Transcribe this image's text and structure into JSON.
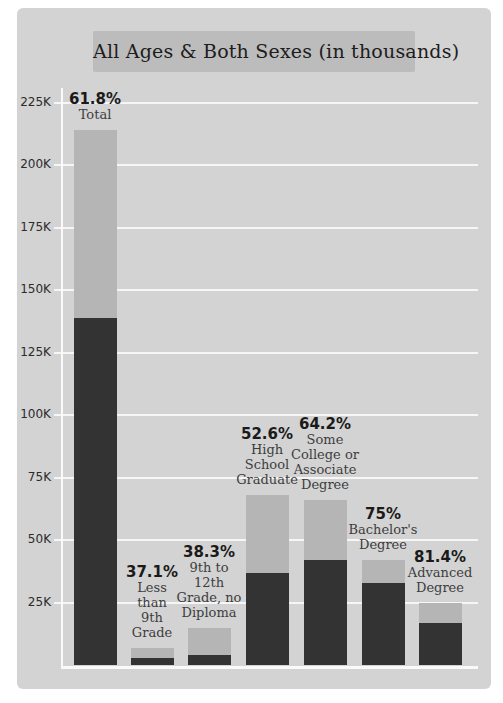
{
  "page_title": "All Ages & Both Sexes (in thousands)",
  "chart_data": {
    "type": "bar",
    "variant": "overlaid-two-tone-stacked",
    "title": "All Ages & Both Sexes (in thousands)",
    "units": "thousands",
    "grid": true,
    "legend": "none",
    "xlabel": "",
    "ylabel": "",
    "ylim": [
      0,
      230
    ],
    "categories": [
      "Total",
      "Less than 9th Grade",
      "9th to 12th Grade, no Diploma",
      "High School Graduate",
      "Some College or Associate Degree",
      "Bachelor's Degree",
      "Advanced Degree"
    ],
    "category_label_lines": [
      [
        "Total"
      ],
      [
        "Less",
        "than",
        "9th",
        "Grade"
      ],
      [
        "9th to",
        "12th",
        "Grade, no",
        "Diploma"
      ],
      [
        "High",
        "School",
        "Graduate"
      ],
      [
        "Some",
        "College or",
        "Associate",
        "Degree"
      ],
      [
        "Bachelor's",
        "Degree"
      ],
      [
        "Advanced",
        "Degree"
      ]
    ],
    "percent_labels": [
      "61.8%",
      "37.1%",
      "38.3%",
      "52.6%",
      "64.2%",
      "75%",
      "81.4%"
    ],
    "series": [
      {
        "name": "total-population-thousands",
        "color": "#b5b5b5",
        "values": [
          214,
          7,
          15,
          68,
          66,
          42,
          25
        ]
      },
      {
        "name": "highlighted-subset-thousands",
        "color": "#333333",
        "values": [
          139,
          3,
          4,
          37,
          42,
          33,
          17
        ]
      }
    ],
    "y_ticks": [
      {
        "value": 225,
        "label": "225K"
      },
      {
        "value": 200,
        "label": "200K"
      },
      {
        "value": 175,
        "label": "175K"
      },
      {
        "value": 150,
        "label": "150K"
      },
      {
        "value": 125,
        "label": "125K"
      },
      {
        "value": 100,
        "label": "100K"
      },
      {
        "value": 75,
        "label": "75K"
      },
      {
        "value": 50,
        "label": "50K"
      },
      {
        "value": 25,
        "label": "25K"
      }
    ]
  },
  "colors": {
    "page_bg": "#ffffff",
    "card_bg": "#d3d3d3",
    "title_box_bg": "#bcbcbc",
    "title_text": "#1d1d1d",
    "bar_light": "#b5b5b5",
    "bar_dark": "#333333",
    "gridline": "#f6f6f6",
    "axis_line": "#fafafa",
    "percent_text": "#1a1a1a",
    "category_text": "#3d3d3d",
    "tick_text": "#2b2b2b"
  }
}
